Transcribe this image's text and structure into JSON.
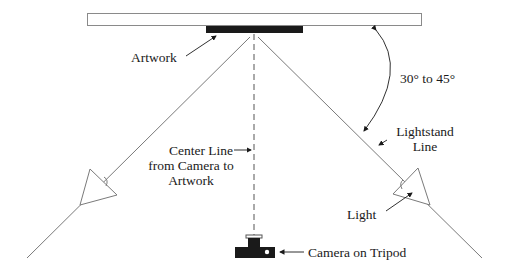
{
  "diagram": {
    "type": "lighting-setup",
    "labels": {
      "artwork": "Artwork",
      "angle": "30° to 45°",
      "lightstand_line_1": "Lightstand",
      "lightstand_line_2": "Line",
      "center_line_1": "Center Line",
      "center_line_2": "from Camera to",
      "center_line_3": "Artwork",
      "light": "Light",
      "camera": "Camera on Tripod"
    },
    "colors": {
      "line": "#7a7a7a",
      "fill": "#1a1a1a",
      "text": "#1a1a1a"
    }
  }
}
